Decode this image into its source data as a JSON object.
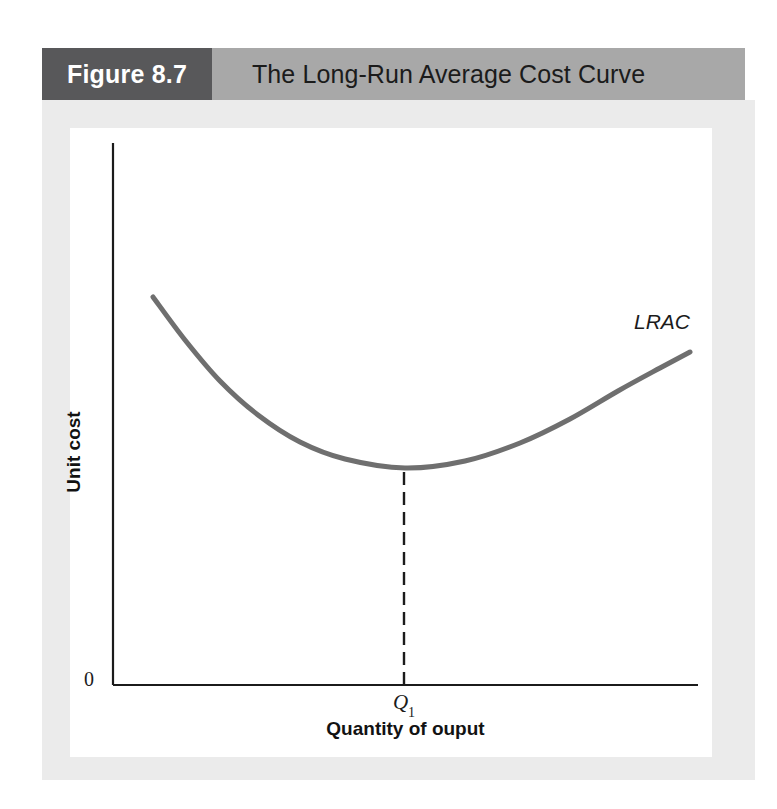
{
  "figure": {
    "number_label": "Figure 8.7",
    "title": "The Long-Run Average Cost Curve"
  },
  "chart_data": {
    "type": "line",
    "title": "The Long-Run Average Cost Curve",
    "xlabel": "Quantity of ouput",
    "ylabel": "Unit cost",
    "origin_label": "0",
    "grid": false,
    "legend_position": "inline-right-end",
    "axis_ranges": {
      "x_pixels": [
        113,
        698
      ],
      "y_pixels": [
        143,
        685
      ]
    },
    "annotations": [
      {
        "name": "curve-label",
        "text": "LRAC",
        "style": "italic"
      },
      {
        "name": "q1-tick",
        "text": "Q",
        "subscript": "1"
      }
    ],
    "series": [
      {
        "name": "LRAC",
        "description": "U-shaped long-run average cost curve",
        "color": "#6f6f6f",
        "stroke_width": 5,
        "points": [
          {
            "x": 153,
            "y": 297
          },
          {
            "x": 185,
            "y": 340
          },
          {
            "x": 220,
            "y": 381
          },
          {
            "x": 258,
            "y": 415
          },
          {
            "x": 300,
            "y": 442
          },
          {
            "x": 345,
            "y": 459
          },
          {
            "x": 405,
            "y": 468
          },
          {
            "x": 465,
            "y": 461
          },
          {
            "x": 520,
            "y": 443
          },
          {
            "x": 570,
            "y": 419
          },
          {
            "x": 618,
            "y": 391
          },
          {
            "x": 660,
            "y": 368
          },
          {
            "x": 690,
            "y": 352
          }
        ]
      }
    ],
    "reference_lines": [
      {
        "name": "q1-dashed-line",
        "orientation": "vertical",
        "x": 404,
        "y_from": 472,
        "y_to": 685,
        "style": "dashed",
        "color": "#1b1b1b"
      }
    ],
    "minimum_point": {
      "x": 405,
      "y": 468,
      "x_label": "Q1"
    }
  },
  "colors": {
    "figure_number_bg": "#58585a",
    "header_bar_bg": "#a8a8a8",
    "panel_bg": "#ebebeb",
    "plot_bg": "#ffffff",
    "curve": "#6f6f6f",
    "axis": "#1b1b1b",
    "title_text": "#1b1b1b",
    "figure_number_text": "#ffffff"
  }
}
